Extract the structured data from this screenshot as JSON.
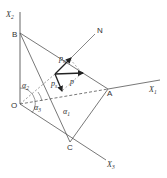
{
  "figure": {
    "points": {
      "O": "O",
      "A": "A",
      "B": "B",
      "C": "C",
      "N": "N"
    },
    "axes": {
      "x1": {
        "base": "X",
        "sub": "1"
      },
      "x2": {
        "base": "X",
        "sub": "2"
      },
      "x3": {
        "base": "X",
        "sub": "3"
      }
    },
    "angles": {
      "a1": {
        "base": "α",
        "sub": "1"
      },
      "a2": {
        "base": "α",
        "sub": "2"
      },
      "a3": {
        "base": "α",
        "sub": "3"
      }
    },
    "vectors": {
      "pn": {
        "base": "p",
        "sub": "n"
      },
      "p": {
        "base": "p"
      },
      "ps": {
        "base": "p",
        "sub": "s"
      }
    },
    "colors": {
      "line": "#555555",
      "vector": "#222222",
      "background": "#ffffff"
    }
  }
}
